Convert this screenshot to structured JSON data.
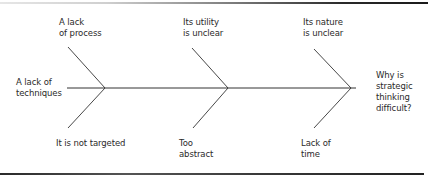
{
  "diagram": {
    "type": "fishbone",
    "effect": {
      "lines": [
        "Why is",
        "strategic",
        "thinking",
        "difficult?"
      ]
    },
    "causes_top": [
      {
        "lines": [
          "A lack",
          "of process"
        ]
      },
      {
        "lines": [
          "Its utility",
          "is unclear"
        ]
      },
      {
        "lines": [
          "Its nature",
          "is unclear"
        ]
      }
    ],
    "causes_bottom": [
      {
        "lines": [
          "It is not targeted"
        ]
      },
      {
        "lines": [
          "Too",
          "abstract"
        ]
      },
      {
        "lines": [
          "Lack of",
          "time"
        ]
      }
    ],
    "cause_tail": {
      "lines": [
        "A lack of",
        "techniques"
      ]
    },
    "colors": {
      "line": "#333333",
      "text": "#2a2a2a"
    }
  }
}
